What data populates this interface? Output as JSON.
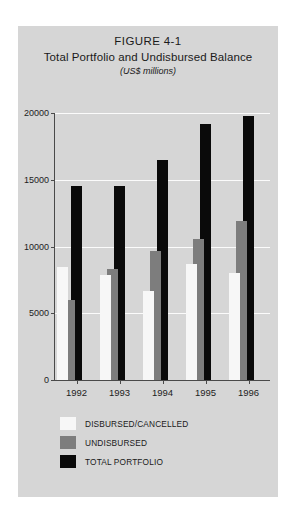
{
  "chart_data": {
    "type": "bar",
    "title": "FIGURE 4-1",
    "subtitle": "Total Portfolio and Undisbursed Balance",
    "units": "(US$ millions)",
    "xlabel": "",
    "ylabel": "",
    "categories": [
      "1992",
      "1993",
      "1994",
      "1995",
      "1996"
    ],
    "series": [
      {
        "name": "DISBURSED/CANCELLED",
        "color": "#f7f7f7",
        "values": [
          8500,
          7900,
          6700,
          8700,
          8000
        ]
      },
      {
        "name": "UNDISBURSED",
        "color": "#7d7d7d",
        "values": [
          6000,
          8300,
          9700,
          10600,
          11900
        ]
      },
      {
        "name": "TOTAL PORTFOLIO",
        "color": "#0a0a0a",
        "values": [
          14500,
          14500,
          16500,
          19200,
          19800
        ]
      }
    ],
    "ylim": [
      0,
      20000
    ],
    "yticks": [
      0,
      5000,
      10000,
      15000,
      20000
    ],
    "ytick_labels": [
      "0",
      "5000",
      "10000",
      "15000",
      "20000"
    ],
    "grid": true,
    "gridline_color": "#fbfbfb",
    "legend_position": "below",
    "panel_color": "#d6d6d6"
  }
}
